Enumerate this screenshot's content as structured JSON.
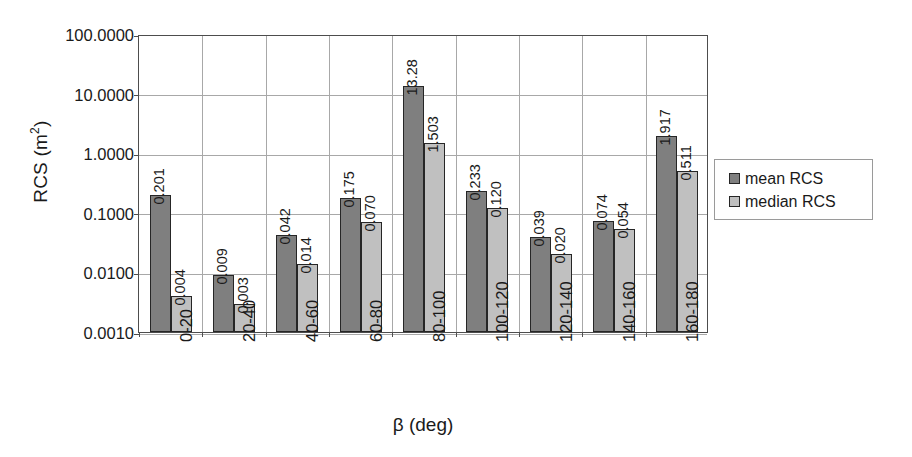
{
  "chart_data": {
    "type": "bar",
    "title": "",
    "xlabel": "β (deg)",
    "ylabel_text": "RCS (m",
    "ylabel_sup": "2",
    "ylabel_tail": ")",
    "ylabel_full": "RCS (m2)",
    "yscale": "log",
    "ylim": [
      0.001,
      100.0
    ],
    "grid": true,
    "legend_position": "right",
    "categories": [
      "0-20",
      "20-40",
      "40-60",
      "60-80",
      "80-100",
      "100-120",
      "120-140",
      "140-160",
      "160-180"
    ],
    "ytick_labels": [
      "100.0000",
      "10.0000",
      "1.0000",
      "0.1000",
      "0.0100",
      "0.0010"
    ],
    "ytick_values": [
      100.0,
      10.0,
      1.0,
      0.1,
      0.01,
      0.001
    ],
    "series": [
      {
        "name": "mean RCS",
        "color": "#7f7f7f",
        "values": [
          0.201,
          0.009,
          0.042,
          0.175,
          13.28,
          0.233,
          0.039,
          0.074,
          1.917
        ],
        "labels": [
          "0.201",
          "0.009",
          "0.042",
          "0.175",
          "13.28",
          "0.233",
          "0.039",
          "0.074",
          "1.917"
        ]
      },
      {
        "name": "median RCS",
        "color": "#c0c0c0",
        "values": [
          0.004,
          0.003,
          0.014,
          0.07,
          1.503,
          0.12,
          0.02,
          0.054,
          0.511
        ],
        "labels": [
          "0.004",
          "0.003",
          "0.014",
          "0.070",
          "1.503",
          "0.120",
          "0.020",
          "0.054",
          "0.511"
        ]
      }
    ]
  },
  "legend": {
    "items": [
      {
        "label": "mean RCS",
        "color": "#7f7f7f"
      },
      {
        "label": "median RCS",
        "color": "#c0c0c0"
      }
    ]
  }
}
